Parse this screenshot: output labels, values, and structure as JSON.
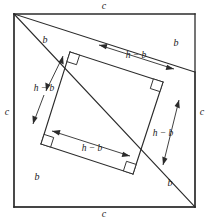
{
  "figure": {
    "type": "geometric-diagram",
    "colors": {
      "stroke": "#2b2b2b",
      "label": "#1a1a1a",
      "background": "#ffffff"
    },
    "outer_square": {
      "side_label": "c",
      "edges": [
        {
          "name": "top",
          "label": "c"
        },
        {
          "name": "right",
          "label": "c"
        },
        {
          "name": "bottom",
          "label": "c"
        },
        {
          "name": "left",
          "label": "c"
        }
      ]
    },
    "segment_labels": [
      {
        "name": "top-left",
        "label": "b"
      },
      {
        "name": "top-right",
        "label": "b"
      },
      {
        "name": "bottom-left",
        "label": "b"
      },
      {
        "name": "bottom-right",
        "label": "b"
      }
    ],
    "dimension_labels": [
      {
        "name": "top",
        "label": "h − b"
      },
      {
        "name": "left",
        "label": "h − b"
      },
      {
        "name": "right",
        "label": "h − b"
      },
      {
        "name": "bottom",
        "label": "h − b"
      }
    ],
    "right_angle_marks": [
      {
        "name": "top-left"
      },
      {
        "name": "top-right"
      },
      {
        "name": "bottom-left"
      },
      {
        "name": "bottom-right"
      }
    ]
  }
}
